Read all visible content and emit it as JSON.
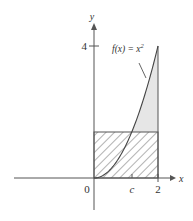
{
  "diagram": {
    "type": "area-under-curve",
    "function_label": "f(x) = x",
    "function_exponent": "2",
    "axes": {
      "x_label": "x",
      "y_label": "y",
      "x_ticks": [
        {
          "value": 0,
          "label": "0"
        },
        {
          "value": "c",
          "label": "c"
        },
        {
          "value": 2,
          "label": "2"
        }
      ],
      "y_ticks": [
        {
          "value": 4,
          "label": "4"
        }
      ]
    },
    "curve": {
      "equation": "y = x^2",
      "domain": [
        0,
        2
      ]
    },
    "rectangle": {
      "x_from": 0,
      "x_to": 2,
      "height": "f(c)",
      "fill": "hatched"
    },
    "shaded_region": {
      "description": "area between curve and rectangle top, above rectangle",
      "fill": "light gray"
    },
    "colors": {
      "axis": "#555555",
      "curve": "#444444",
      "hatch": "#555555",
      "shade": "#e6e6e6",
      "text": "#333333"
    }
  }
}
